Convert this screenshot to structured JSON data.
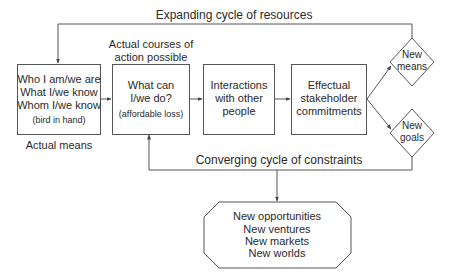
{
  "top_loop_label": "Expanding cycle of resources",
  "bottom_loop_label": "Converging cycle of constraints",
  "actual_means": {
    "lines": [
      "Who I am/we are",
      "What I/we know",
      "Whom I/we know"
    ],
    "note": "(bird in hand)",
    "caption": "Actual means"
  },
  "courses_caption": [
    "Actual courses of",
    "action possible"
  ],
  "what_can": {
    "lines": [
      "What can",
      "I/we do?"
    ],
    "note": "(affordable loss)"
  },
  "interactions": {
    "lines": [
      "Interactions",
      "with other",
      "people"
    ]
  },
  "commitments": {
    "lines": [
      "Effectual",
      "stakeholder",
      "commitments"
    ]
  },
  "new_means": {
    "lines": [
      "New",
      "means"
    ]
  },
  "new_goals": {
    "lines": [
      "New",
      "goals"
    ]
  },
  "outcomes": {
    "lines": [
      "New opportunities",
      "New ventures",
      "New markets",
      "New worlds"
    ]
  },
  "colors": {
    "stroke": "#555555",
    "text": "#2a2a2a",
    "background": "#ffffff"
  }
}
